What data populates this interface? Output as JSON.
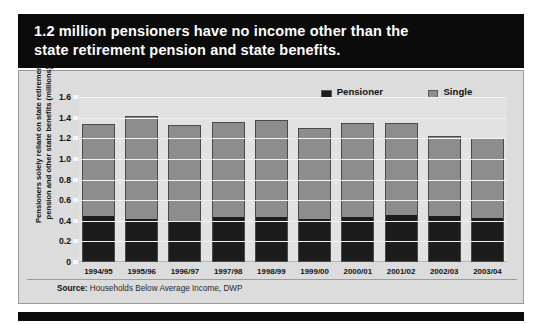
{
  "title": {
    "line1": "1.2 million pensioners have no income other than the",
    "line2": "state retirement pension and state benefits."
  },
  "legend": {
    "items": [
      {
        "label": "Pensioner couples",
        "color": "#1c1c1c"
      },
      {
        "label": "Single pensioners",
        "color": "#8d8d8d"
      }
    ]
  },
  "source": {
    "prefix": "Source:",
    "text": " Households Below Average Income, DWP"
  },
  "chart_data": {
    "type": "bar",
    "stacked": true,
    "title": "1.2 million pensioners have no income other than the state retirement pension and state benefits.",
    "xlabel": "",
    "ylabel": "Pensioners solely reliant on state retirement pension and other state benefits (millions)",
    "ylim": [
      0,
      1.6
    ],
    "yticks": [
      0,
      0.2,
      0.4,
      0.6,
      0.8,
      1.0,
      1.2,
      1.4,
      1.6
    ],
    "ytick_labels": [
      "0",
      "0.2",
      "0.4",
      "0.6",
      "0.8",
      "1.0",
      "1.2",
      "1.4",
      "1.6"
    ],
    "grid": true,
    "legend_position": "top-right",
    "categories": [
      "1994/95",
      "1995/96",
      "1996/97",
      "1997/98",
      "1998/99",
      "1999/00",
      "2000/01",
      "2001/02",
      "2002/03",
      "2003/04"
    ],
    "series": [
      {
        "name": "Pensioner couples",
        "color": "#1c1c1c",
        "values": [
          0.44,
          0.41,
          0.38,
          0.43,
          0.43,
          0.41,
          0.43,
          0.45,
          0.44,
          0.42
        ]
      },
      {
        "name": "Single pensioners",
        "color": "#8d8d8d",
        "values": [
          0.9,
          1.01,
          0.95,
          0.93,
          0.95,
          0.89,
          0.92,
          0.9,
          0.78,
          0.78
        ]
      }
    ],
    "totals": [
      1.34,
      1.42,
      1.33,
      1.36,
      1.38,
      1.3,
      1.35,
      1.35,
      1.22,
      1.2
    ],
    "source": "Source: Households Below Average Income, DWP"
  }
}
